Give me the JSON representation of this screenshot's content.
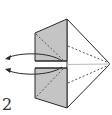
{
  "diagram": {
    "type": "origami-step",
    "step_number": "2",
    "colors": {
      "paper_shaded": "#c4c4c4",
      "paper_white": "#ffffff",
      "outline": "#2a2a2a",
      "fold_line": "#555555"
    },
    "elements": {
      "top_flap": "shaded",
      "bottom_flap": "shaded",
      "kite_body": "white",
      "valley_folds": 4,
      "arrows": 2
    }
  }
}
